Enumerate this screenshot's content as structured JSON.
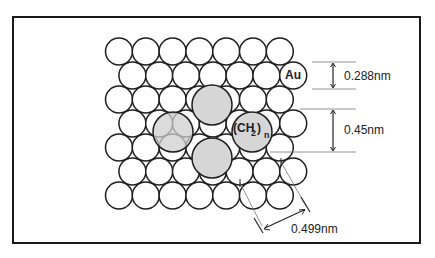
{
  "diagram": {
    "title": "",
    "substrate_label": "Au",
    "adsorbate_label": "(CH",
    "adsorbate_sub": "2",
    "adsorbate_close": ")",
    "adsorbate_n": "n",
    "dimensions": {
      "au_spacing": "0.288nm",
      "chain_spacing": "0.45nm",
      "diagonal_spacing": "0.499nm"
    },
    "lattice": {
      "rows": 7,
      "circles_per_row": 7,
      "pitch_x": 26.8,
      "pitch_y": 24,
      "radius": 13.5
    },
    "colors": {
      "frame": "#1a1a1a",
      "au_fill": "#ffffff",
      "adsorbate_fill": "#d6d6d6",
      "stroke": "#1e1e1e"
    }
  }
}
